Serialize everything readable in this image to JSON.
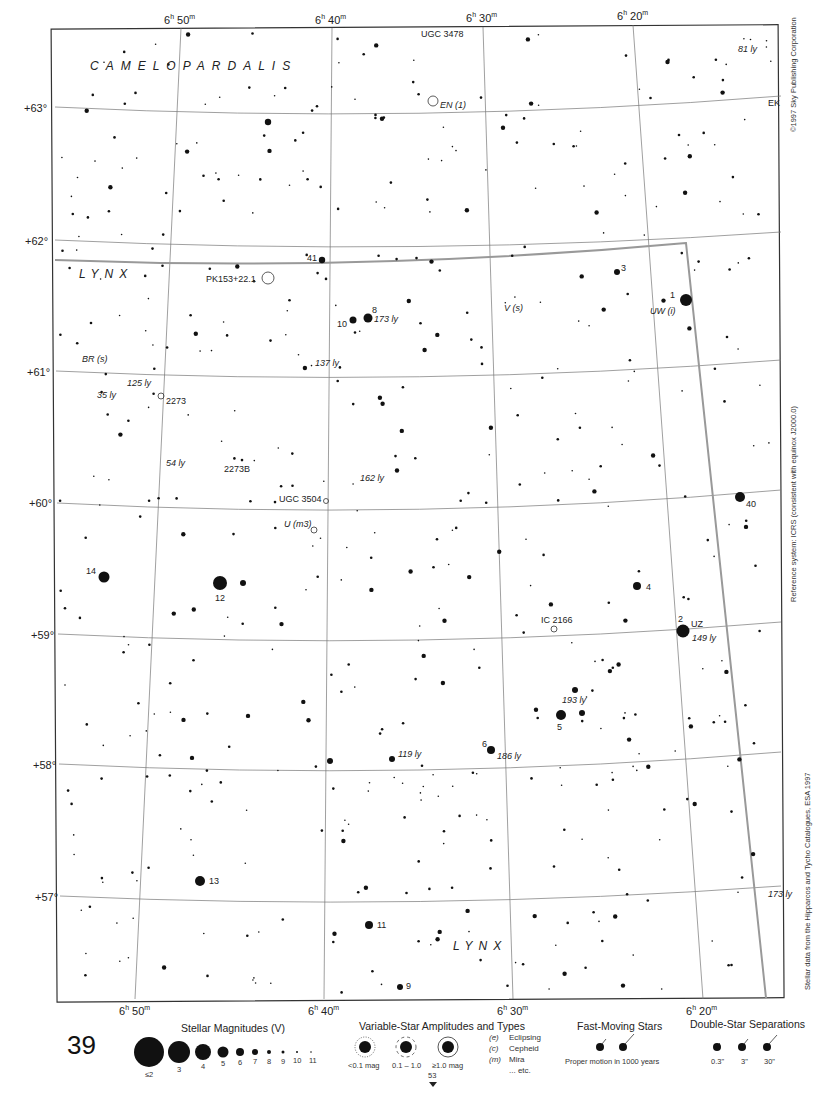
{
  "page": {
    "number": "39",
    "top_page_ref": "153",
    "adjacent_chart_ref": "53"
  },
  "chart_frame": {
    "constellations": [
      "CAMELOPARDALIS",
      "LYNX",
      "LYNX"
    ],
    "ra_labels_top": [
      "6h 50m",
      "6h 40m",
      "6h 30m",
      "6h 20m"
    ],
    "ra_labels_bottom": [
      "6h 50m",
      "6h 40m",
      "6h 30m",
      "6h 20m"
    ],
    "dec_labels": [
      "+63°",
      "+62°",
      "+61°",
      "+60°",
      "+59°",
      "+58°",
      "+57°"
    ]
  },
  "side_notes": {
    "copyright": "©1997 Sky Publishing Corporation",
    "reference": "Reference system: ICRS (consistent with equinox J2000.0)",
    "source": "Stellar data from the Hipparcos and Tycho Catalogues, ESA 1997"
  },
  "labels": [
    {
      "text": "UGC 3478",
      "x": 421,
      "y": 37
    },
    {
      "text": "EN (1)",
      "x": 440,
      "y": 108
    },
    {
      "text": "EK",
      "x": 768,
      "y": 106
    },
    {
      "text": "81 ly",
      "x": 738,
      "y": 52
    },
    {
      "text": "PK153+22.1",
      "x": 206,
      "y": 282
    },
    {
      "text": "41",
      "x": 307,
      "y": 261
    },
    {
      "text": "3",
      "x": 621,
      "y": 271
    },
    {
      "text": "1",
      "x": 670,
      "y": 298
    },
    {
      "text": "UW (i)",
      "x": 650,
      "y": 314
    },
    {
      "text": "V (s)",
      "x": 504,
      "y": 311
    },
    {
      "text": "8",
      "x": 372,
      "y": 313
    },
    {
      "text": "173 ly",
      "x": 374,
      "y": 322
    },
    {
      "text": "10",
      "x": 337,
      "y": 327
    },
    {
      "text": "BR (s)",
      "x": 82,
      "y": 362
    },
    {
      "text": "137 ly",
      "x": 315,
      "y": 366
    },
    {
      "text": "125 ly",
      "x": 127,
      "y": 386
    },
    {
      "text": "35 ly",
      "x": 97,
      "y": 398
    },
    {
      "text": "2273",
      "x": 166,
      "y": 404
    },
    {
      "text": "54 ly",
      "x": 166,
      "y": 466
    },
    {
      "text": "2273B",
      "x": 224,
      "y": 472
    },
    {
      "text": "162 ly",
      "x": 360,
      "y": 481
    },
    {
      "text": "UGC 3504",
      "x": 279,
      "y": 502
    },
    {
      "text": "U (m3)",
      "x": 284,
      "y": 527
    },
    {
      "text": "40",
      "x": 746,
      "y": 507
    },
    {
      "text": "14",
      "x": 86,
      "y": 574
    },
    {
      "text": "12",
      "x": 215,
      "y": 601
    },
    {
      "text": "4",
      "x": 646,
      "y": 590
    },
    {
      "text": "IC 2166",
      "x": 541,
      "y": 623
    },
    {
      "text": "2",
      "x": 678,
      "y": 622
    },
    {
      "text": "UZ",
      "x": 691,
      "y": 627
    },
    {
      "text": "149 ly",
      "x": 692,
      "y": 641
    },
    {
      "text": "193 ly",
      "x": 562,
      "y": 703
    },
    {
      "text": "5",
      "x": 557,
      "y": 730
    },
    {
      "text": "6",
      "x": 482,
      "y": 747
    },
    {
      "text": "186 ly",
      "x": 497,
      "y": 759
    },
    {
      "text": "119 ly",
      "x": 398,
      "y": 757
    },
    {
      "text": "13",
      "x": 209,
      "y": 884
    },
    {
      "text": "11",
      "x": 377,
      "y": 928
    },
    {
      "text": "173 ly",
      "x": 768,
      "y": 897
    },
    {
      "text": "9",
      "x": 406,
      "y": 989
    }
  ],
  "legend": {
    "magnitudes": {
      "title": "Stellar Magnitudes (V)",
      "items": [
        "≤2",
        "3",
        "4",
        "5",
        "6",
        "7",
        "8",
        "9",
        "10",
        "11"
      ]
    },
    "variables": {
      "title": "Variable-Star Amplitudes and Types",
      "amplitudes": [
        "<0.1 mag",
        "0.1 – 1.0",
        "≥1.0 mag"
      ],
      "types": [
        {
          "code": "(e)",
          "name": "Eclipsing"
        },
        {
          "code": "(c)",
          "name": "Cepheid"
        },
        {
          "code": "(m)",
          "name": "Mira"
        },
        {
          "code": "",
          "name": "... etc."
        }
      ]
    },
    "fast_moving": {
      "title": "Fast-Moving Stars",
      "caption": "Proper motion in 1000 years"
    },
    "double_stars": {
      "title": "Double-Star Separations",
      "items": [
        "0.3\"",
        "3\"",
        "30\""
      ]
    }
  }
}
